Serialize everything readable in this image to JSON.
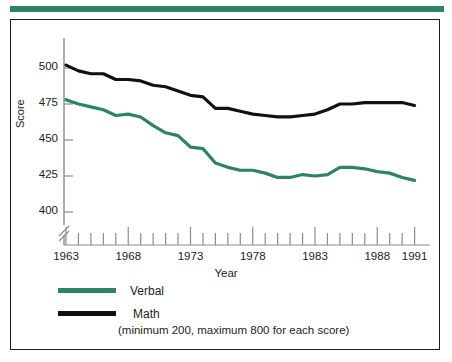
{
  "figure": {
    "accent_color": "#2d8461",
    "frame_color": "#1d1d1d",
    "background": "#ffffff"
  },
  "chart_data": {
    "type": "line",
    "title": "",
    "xlabel": "Year",
    "ylabel": "Score",
    "xlim": [
      1963,
      1991
    ],
    "ylim": [
      390,
      510
    ],
    "yticks": [
      400,
      425,
      450,
      475,
      500
    ],
    "xticks": [
      1963,
      1968,
      1973,
      1978,
      1983,
      1988,
      1991
    ],
    "x_minor_tick_every": 1,
    "y_axis_break": true,
    "grid": false,
    "legend_position": "below-axes",
    "annotation": "(minimum 200, maximum 800 for each score)",
    "x": [
      1963,
      1964,
      1965,
      1966,
      1967,
      1968,
      1969,
      1970,
      1971,
      1972,
      1973,
      1974,
      1975,
      1976,
      1977,
      1978,
      1979,
      1980,
      1981,
      1982,
      1983,
      1984,
      1985,
      1986,
      1987,
      1988,
      1989,
      1990,
      1991
    ],
    "series": [
      {
        "name": "Verbal",
        "color": "#2d8461",
        "values": [
          478,
          475,
          473,
          471,
          467,
          468,
          466,
          460,
          455,
          453,
          445,
          444,
          434,
          431,
          429,
          429,
          427,
          424,
          424,
          426,
          425,
          426,
          431,
          431,
          430,
          428,
          427,
          424,
          422
        ]
      },
      {
        "name": "Math",
        "color": "#111111",
        "values": [
          502,
          498,
          496,
          496,
          492,
          492,
          491,
          488,
          487,
          484,
          481,
          480,
          472,
          472,
          470,
          468,
          467,
          466,
          466,
          467,
          468,
          471,
          475,
          475,
          476,
          476,
          476,
          476,
          474
        ]
      }
    ]
  },
  "legend": {
    "items": [
      {
        "label": "Verbal",
        "color": "#2d8461"
      },
      {
        "label": "Math",
        "color": "#111111"
      }
    ],
    "note": "(minimum 200, maximum 800 for each score)"
  },
  "axes": {
    "y_title": "Score",
    "x_title": "Year",
    "y_tick_labels": [
      "500",
      "475",
      "450",
      "425",
      "400"
    ],
    "x_tick_labels": [
      "1963",
      "1968",
      "1973",
      "1978",
      "1983",
      "1988",
      "1991"
    ]
  }
}
